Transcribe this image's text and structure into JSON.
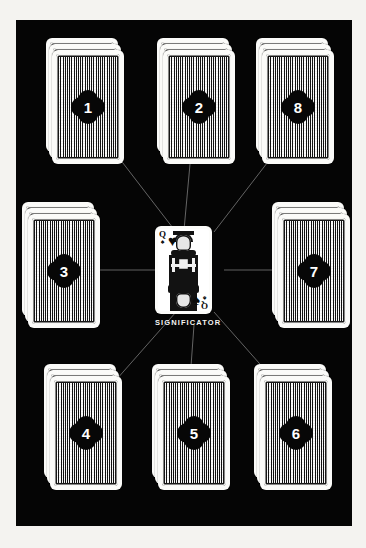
{
  "scene": {
    "title": "Eight-pile card spread with central significator",
    "background_color": "#050505",
    "frame_color": "#f4f3f0",
    "card_face_color": "#fbfbf9",
    "badge_color": "#070707",
    "badge_text_color": "#ffffff",
    "line_color": "#6e6e6e"
  },
  "significator": {
    "label": "SIGNIFICATOR",
    "rank": "Q",
    "rank_name": "Queen",
    "corner_suit": "♠",
    "face_suit": "♥",
    "bottom_suit": "♠",
    "card_type": "face-up-court-card"
  },
  "piles": [
    {
      "number": "1",
      "position": "top-center",
      "cards_in_pile": 3,
      "x": 141,
      "y": 18,
      "w": 72,
      "h": 114
    },
    {
      "number": "2",
      "position": "top-left",
      "cards_in_pile": 3,
      "x": 30,
      "y": 18,
      "w": 72,
      "h": 114
    },
    {
      "number": "8",
      "position": "top-right",
      "cards_in_pile": 3,
      "x": 240,
      "y": 18,
      "w": 72,
      "h": 114
    },
    {
      "number": "3",
      "position": "middle-left",
      "cards_in_pile": 3,
      "x": 6,
      "y": 182,
      "w": 72,
      "h": 114
    },
    {
      "number": "7",
      "position": "middle-right",
      "cards_in_pile": 3,
      "x": 256,
      "y": 182,
      "w": 72,
      "h": 114
    },
    {
      "number": "4",
      "position": "bottom-left",
      "cards_in_pile": 3,
      "x": 28,
      "y": 344,
      "w": 72,
      "h": 114
    },
    {
      "number": "5",
      "position": "bottom-center",
      "cards_in_pile": 3,
      "x": 136,
      "y": 344,
      "w": 72,
      "h": 114
    },
    {
      "number": "6",
      "position": "bottom-right",
      "cards_in_pile": 3,
      "x": 238,
      "y": 344,
      "w": 72,
      "h": 114
    }
  ],
  "connectors": [
    {
      "from": "significator",
      "to": "1"
    },
    {
      "from": "significator",
      "to": "2"
    },
    {
      "from": "significator",
      "to": "8"
    },
    {
      "from": "significator",
      "to": "3"
    },
    {
      "from": "significator",
      "to": "7"
    },
    {
      "from": "significator",
      "to": "4"
    },
    {
      "from": "significator",
      "to": "5"
    },
    {
      "from": "significator",
      "to": "6"
    }
  ]
}
